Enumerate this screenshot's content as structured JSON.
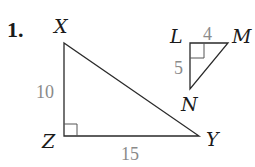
{
  "problem_number": "1.",
  "triangles": [
    {
      "name": "XYZ",
      "vertices": {
        "X": "X",
        "Y": "Y",
        "Z": "Z"
      },
      "right_angle_at": "Z",
      "side_labels": {
        "XZ": "10",
        "ZY": "15"
      }
    },
    {
      "name": "LMN",
      "vertices": {
        "L": "L",
        "M": "M",
        "N": "N"
      },
      "right_angle_at": "L",
      "side_labels": {
        "LM": "4",
        "LN": "5"
      }
    }
  ],
  "colors": {
    "lines": "#2a2a2a",
    "side_numbers": "#8a8a8a",
    "vertex_labels": "#1a1a1a"
  }
}
